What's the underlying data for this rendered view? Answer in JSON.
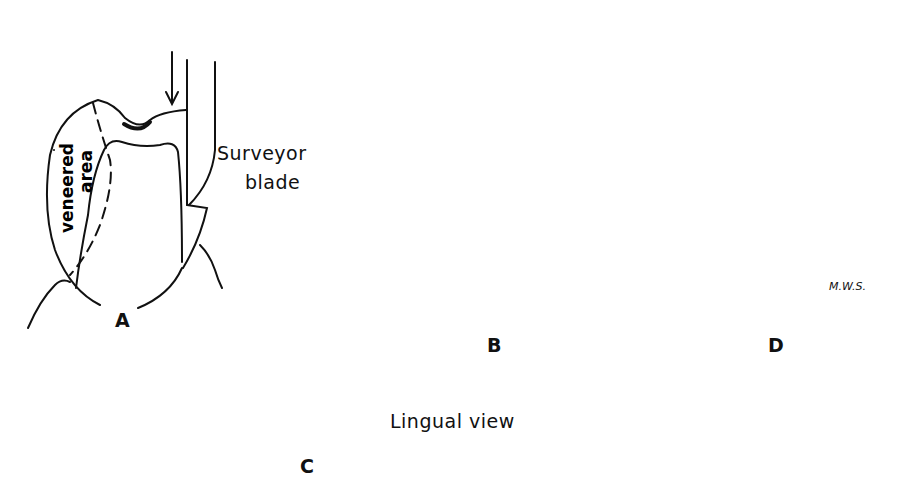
{
  "figure": {
    "panels": [
      {
        "id": "A",
        "label": "A",
        "annotations": {
          "veneered": "veneered",
          "area": "area",
          "surveyor_line1": "Surveyor",
          "surveyor_line2": "blade"
        }
      },
      {
        "id": "B",
        "label": "B"
      },
      {
        "id": "C",
        "label": "C",
        "annotations": {
          "view": "Lingual view"
        }
      },
      {
        "id": "D",
        "label": "D",
        "annotations": {
          "signature": "M.W.S."
        }
      }
    ],
    "colors": {
      "ink": "#111111",
      "background": "#ffffff",
      "stipple": "#d8d8d8"
    }
  }
}
